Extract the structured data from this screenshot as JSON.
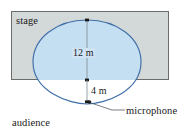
{
  "figure": {
    "labels": {
      "stage": "stage",
      "audience": "audience",
      "microphone": "microphone"
    },
    "dimensions": {
      "vertical_span": "12 m",
      "cusp_offset": "4 m"
    },
    "colors": {
      "stage_fill": "#d3d8d8",
      "stage_border": "#6b6b6b",
      "curve_stroke": "#3f6ea8",
      "curve_fill": "#c5dff2",
      "leader_line": "#555a63",
      "tick_mark": "#1a1a1a",
      "text": "#1a1a1a"
    },
    "geometry": {
      "stage_rect": {
        "x": 11,
        "y": 11,
        "width": 158,
        "height": 69
      },
      "cardioid": {
        "cusp_x": 87,
        "cusp_y": 104,
        "apex_y": 20,
        "left_x": 33,
        "right_x": 141
      },
      "dim_line_12": {
        "x": 87,
        "y_top": 20,
        "y_bottom": 80
      },
      "dim_line_4": {
        "x": 87,
        "y_top": 80,
        "y_bottom": 104
      },
      "mic_dot": {
        "x": 89,
        "y": 102,
        "r": 1.8
      }
    },
    "icons": {
      "mic_point": "microphone-point-marker"
    }
  }
}
